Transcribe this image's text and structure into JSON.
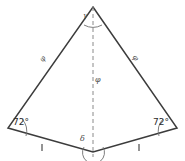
{
  "figure": {
    "type": "geometry-diagram",
    "shape": "concave quadrilateral (dart/arrowhead)",
    "background_color": "#ffffff",
    "stroke_color": "#3c3c3c",
    "dashed_color": "#8a8a8a",
    "arc_color": "#6e6e6e",
    "vertices": {
      "apex": {
        "x": 93,
        "y": 7,
        "label": "γ"
      },
      "left": {
        "x": 8,
        "y": 128,
        "label": "72°"
      },
      "right": {
        "x": 177,
        "y": 128,
        "label": "72°"
      },
      "bottom": {
        "x": 93,
        "y": 152,
        "label": "δ"
      }
    },
    "labels": {
      "angle_left": "72°",
      "angle_right": "72°",
      "angle_apex": "γ",
      "angle_bottom": "δ",
      "side_left": "φ",
      "side_right": "φ",
      "diagonal": "φ"
    },
    "tick_marks": {
      "count": 2,
      "description": "single tick on each lower edge indicating equal lengths",
      "left_tick": {
        "x": 42,
        "y": 147
      },
      "right_tick": {
        "x": 138,
        "y": 147
      }
    },
    "arcs": [
      {
        "name": "apex-angle-arc",
        "at": "apex"
      },
      {
        "name": "bottom-angle-arc",
        "at": "bottom"
      },
      {
        "name": "left-angle-arc",
        "at": "left"
      },
      {
        "name": "right-angle-arc",
        "at": "right"
      }
    ],
    "diagonal": {
      "from": "apex",
      "to": "bottom",
      "style": "dashed"
    }
  }
}
